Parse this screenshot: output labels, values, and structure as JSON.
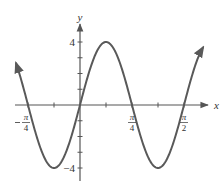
{
  "chart_data": {
    "type": "line",
    "title": "",
    "function": "y = 4 sin(4x)",
    "xlabel": "x",
    "ylabel": "y",
    "x_domain_pi": [
      -1.23,
      2.365
    ],
    "xlim_pi_over_4": [
      -1.23,
      2.365
    ],
    "ylim": [
      -4,
      4
    ],
    "x_ticks": [
      {
        "value_pi_over_4": -1,
        "label_num": "π",
        "label_den": "4",
        "negative": true
      },
      {
        "value_pi_over_4": -0.5,
        "label_num": "",
        "label_den": "",
        "negative": false
      },
      {
        "value_pi_over_4": 0.5,
        "label_num": "",
        "label_den": "",
        "negative": false
      },
      {
        "value_pi_over_4": 1,
        "label_num": "π",
        "label_den": "4",
        "negative": false
      },
      {
        "value_pi_over_4": 1.5,
        "label_num": "",
        "label_den": "",
        "negative": false
      },
      {
        "value_pi_over_4": 2,
        "label_num": "π",
        "label_den": "2",
        "negative": false
      }
    ],
    "y_ticks": [
      {
        "value": 4,
        "label": "4"
      },
      {
        "value": 3,
        "label": ""
      },
      {
        "value": 2,
        "label": ""
      },
      {
        "value": 1,
        "label": ""
      },
      {
        "value": -1,
        "label": ""
      },
      {
        "value": -2,
        "label": ""
      },
      {
        "value": -3,
        "label": ""
      },
      {
        "value": -4,
        "label": "−4"
      }
    ],
    "series": [
      {
        "name": "4 sin(4x)",
        "amplitude": 4,
        "angular_frequency": 4,
        "color": "#555555",
        "arrows_at_ends": true
      }
    ],
    "grid": false
  },
  "axis_color": "#555555",
  "curve_color": "#595959"
}
